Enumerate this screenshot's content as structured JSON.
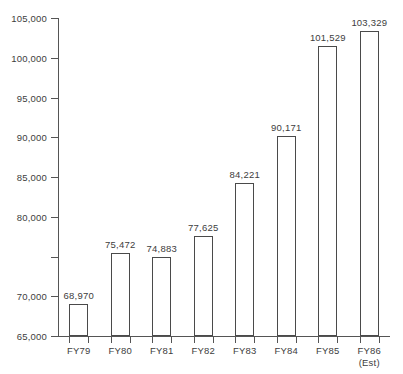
{
  "chart_data": {
    "type": "bar",
    "title": "",
    "subtitle": "",
    "xlabel": "",
    "ylabel": "",
    "categories": [
      "FY79",
      "FY80",
      "FY81",
      "FY82",
      "FY83",
      "FY84",
      "FY85",
      "FY86"
    ],
    "category_sublabels": [
      "",
      "",
      "",
      "",
      "",
      "",
      "",
      "(Est)"
    ],
    "values": [
      68970,
      75472,
      74883,
      77625,
      84221,
      90171,
      101529,
      103329
    ],
    "value_labels": [
      "68,970",
      "75,472",
      "74,883",
      "77,625",
      "84,221",
      "90,171",
      "101,529",
      "103,329"
    ],
    "ylim": [
      65000,
      105000
    ],
    "ytick_values": [
      65000,
      70000,
      75000,
      80000,
      85000,
      90000,
      95000,
      100000,
      105000
    ],
    "ytick_labels": [
      "65,000",
      "70,000",
      "75,000",
      "80,000",
      "85,000",
      "90,000",
      "95,000",
      "100,000",
      "105,000"
    ],
    "ytick_labels_shown": [
      "65,000",
      "70,000",
      "",
      "80,000",
      "85,000",
      "90,000",
      "95,000",
      "100,000",
      "105,000"
    ],
    "grid": false,
    "legend": null,
    "colors": {
      "bar_fill": "#ffffff",
      "bar_stroke": "#4a4a4a",
      "axis": "#555555",
      "text": "#3d3d3d",
      "background": "#ffffff"
    }
  }
}
